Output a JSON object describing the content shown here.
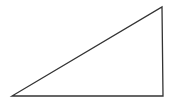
{
  "diagram": {
    "shape": "right-triangle",
    "stroke_color": "#333333",
    "fill_color": "none",
    "background": "#ffffff",
    "stroke_width": 1.3,
    "vertices": [
      {
        "name": "bottom-left",
        "x": 12,
        "y": 96
      },
      {
        "name": "bottom-right",
        "x": 163,
        "y": 96
      },
      {
        "name": "top-right",
        "x": 162,
        "y": 7
      }
    ]
  }
}
